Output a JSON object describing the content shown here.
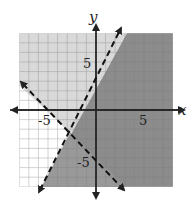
{
  "graph": {
    "x_axis_label": "x",
    "y_axis_label": "y",
    "tick_labels": {
      "x_pos": "5",
      "x_neg": "-5",
      "y_pos": "5",
      "y_neg": "-5"
    },
    "range": {
      "xmin": -8,
      "xmax": 8,
      "ymin": -8,
      "ymax": 8
    },
    "boundary_lines": [
      {
        "equation": "y = 2x + 3",
        "style": "dashed"
      },
      {
        "equation": "y = -x - 5",
        "style": "dashed"
      }
    ],
    "regions": [
      {
        "description": "y < 2x + 3, y > -x - 5",
        "shade": "#8c8c8c"
      },
      {
        "description": "y < 2x + 3, y < -x - 5",
        "shade": "#9a9a9a"
      },
      {
        "description": "y > 2x + 3, y > -x - 5",
        "shade": "#d9d9d9"
      },
      {
        "description": "y > 2x + 3, y < -x - 5",
        "shade": "#ffffff"
      }
    ],
    "colors": {
      "grid": "#9a9a9a",
      "axis": "#222222"
    }
  }
}
